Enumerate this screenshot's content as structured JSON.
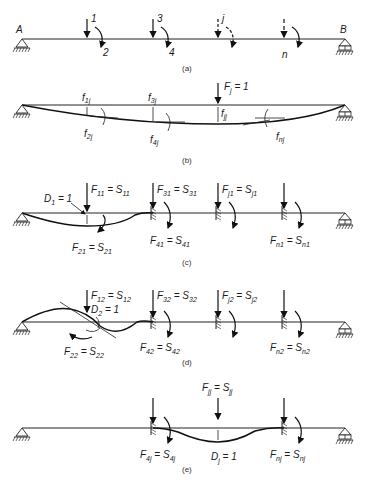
{
  "figure": {
    "panels": [
      {
        "id": "a",
        "caption": "(a)",
        "support_left_label": "A",
        "support_right_label": "B",
        "coordinates": [
          "1",
          "2",
          "3",
          "4",
          "j",
          "n"
        ]
      },
      {
        "id": "b",
        "caption": "(b)",
        "load_label": "F",
        "load_sub": "j",
        "load_value": " = 1",
        "flex": [
          {
            "base": "f",
            "sub": "1j"
          },
          {
            "base": "f",
            "sub": "2j"
          },
          {
            "base": "f",
            "sub": "3j"
          },
          {
            "base": "f",
            "sub": "4j"
          },
          {
            "base": "f",
            "sub": "jj"
          },
          {
            "base": "f",
            "sub": "nj"
          }
        ]
      },
      {
        "id": "c",
        "caption": "(c)",
        "disp_label": "D",
        "disp_sub": "1",
        "disp_value": " = 1",
        "forces": [
          {
            "f": "F",
            "fs": "11",
            "s": "S",
            "ss": "11"
          },
          {
            "f": "F",
            "fs": "21",
            "s": "S",
            "ss": "21"
          },
          {
            "f": "F",
            "fs": "31",
            "s": "S",
            "ss": "31"
          },
          {
            "f": "F",
            "fs": "41",
            "s": "S",
            "ss": "41"
          },
          {
            "f": "F",
            "fs": "j1",
            "s": "S",
            "ss": "j1"
          },
          {
            "f": "F",
            "fs": "n1",
            "s": "S",
            "ss": "n1"
          }
        ]
      },
      {
        "id": "d",
        "caption": "(d)",
        "disp_label": "D",
        "disp_sub": "2",
        "disp_value": " = 1",
        "forces": [
          {
            "f": "F",
            "fs": "12",
            "s": "S",
            "ss": "12"
          },
          {
            "f": "F",
            "fs": "22",
            "s": "S",
            "ss": "22"
          },
          {
            "f": "F",
            "fs": "32",
            "s": "S",
            "ss": "32"
          },
          {
            "f": "F",
            "fs": "42",
            "s": "S",
            "ss": "42"
          },
          {
            "f": "F",
            "fs": "j2",
            "s": "S",
            "ss": "j2"
          },
          {
            "f": "F",
            "fs": "n2",
            "s": "S",
            "ss": "n2"
          }
        ]
      },
      {
        "id": "e",
        "caption": "(e)",
        "disp_label": "D",
        "disp_sub": "j",
        "disp_value": " = 1",
        "forces": [
          {
            "f": "F",
            "fs": "jj",
            "s": "S",
            "ss": "jj"
          },
          {
            "f": "F",
            "fs": "4j",
            "s": "S",
            "ss": "4j"
          },
          {
            "f": "F",
            "fs": "nj",
            "s": "S",
            "ss": "nj"
          }
        ]
      }
    ]
  }
}
